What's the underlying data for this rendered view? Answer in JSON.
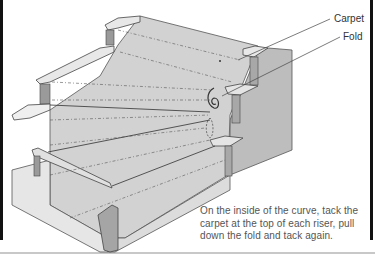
{
  "labels": {
    "carpet": "Carpet",
    "fold": "Fold"
  },
  "caption": "On the inside of the curve, tack the carpet at the top of each riser, pull down the fold and tack again.",
  "colors": {
    "carpet": "#cfcfcf",
    "riser_dark": "#9a9a9a",
    "tread_light": "#e4e4e4",
    "outline": "#444444",
    "frame": "#111111"
  }
}
